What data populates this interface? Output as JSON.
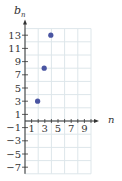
{
  "chart_data": {
    "type": "scatter",
    "title": "",
    "xlabel": "n",
    "ylabel": "b_n",
    "x": [
      1,
      2,
      3
    ],
    "y": [
      3,
      8,
      13
    ],
    "series": [
      {
        "name": "b_n",
        "x": [
          1,
          2,
          3
        ],
        "values": [
          3,
          8,
          13
        ],
        "color": "#4a55a2"
      }
    ],
    "x_tick_labels": [
      "1",
      "3",
      "5",
      "7",
      "9"
    ],
    "y_tick_labels": [
      "13",
      "11",
      "9",
      "7",
      "5",
      "3",
      "1",
      "-1",
      "-3",
      "-5",
      "-7"
    ],
    "xlim": [
      0,
      10
    ],
    "ylim": [
      -8,
      14
    ],
    "grid": true
  },
  "axes": {
    "x_label": "n",
    "y_label_base": "b",
    "y_label_sub": "n"
  },
  "colors": {
    "point": "#4a55a2",
    "grid": "#dde6ea",
    "axis": "#333333"
  }
}
